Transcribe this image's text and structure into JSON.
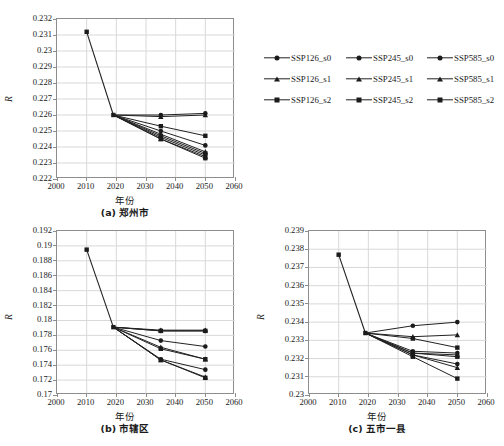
{
  "figure": {
    "axis_y_title": "R",
    "axis_x_title": "年份",
    "panels": [
      {
        "id": "a",
        "caption": "(a) 郑州市",
        "xlim": [
          2000,
          2060
        ],
        "xticks": [
          "2000",
          "2010",
          "2020",
          "2030",
          "2040",
          "2050",
          "2060"
        ],
        "ylim": [
          0.222,
          0.232
        ],
        "yticks": [
          "0.232",
          "0.231",
          "0.23",
          "0.229",
          "0.228",
          "0.227",
          "0.226",
          "0.225",
          "0.224",
          "0.223",
          "0.222"
        ]
      },
      {
        "id": "b",
        "caption": "(b) 市辖区",
        "xlim": [
          2000,
          2060
        ],
        "xticks": [
          "2000",
          "2010",
          "2020",
          "2030",
          "2040",
          "2050",
          "2060"
        ],
        "ylim": [
          0.17,
          0.192
        ],
        "yticks": [
          "0.192",
          "0.19",
          "0.188",
          "0.186",
          "0.184",
          "0.182",
          "0.18",
          "0.178",
          "0.176",
          "0.174",
          "0.172",
          "0.17"
        ]
      },
      {
        "id": "c",
        "caption": "(c) 五市一县",
        "xlim": [
          2000,
          2060
        ],
        "xticks": [
          "2000",
          "2010",
          "2020",
          "2030",
          "2040",
          "2050",
          "2060"
        ],
        "ylim": [
          0.23,
          0.239
        ],
        "yticks": [
          "0.239",
          "0.238",
          "0.237",
          "0.236",
          "0.235",
          "0.234",
          "0.233",
          "0.232",
          "0.231",
          "0.23"
        ]
      }
    ]
  },
  "legend": {
    "position": "right-top",
    "rows": [
      [
        {
          "label": "SSP126_s0",
          "marker": "circle"
        },
        {
          "label": "SSP245_s0",
          "marker": "circle"
        },
        {
          "label": "SSP585_s0",
          "marker": "circle"
        }
      ],
      [
        {
          "label": "SSP126_s1",
          "marker": "triangle"
        },
        {
          "label": "SSP245_s1",
          "marker": "triangle"
        },
        {
          "label": "SSP585_s1",
          "marker": "triangle"
        }
      ],
      [
        {
          "label": "SSP126_s2",
          "marker": "square"
        },
        {
          "label": "SSP245_s2",
          "marker": "square"
        },
        {
          "label": "SSP585_s2",
          "marker": "square"
        }
      ]
    ]
  },
  "chart_data": [
    {
      "type": "line",
      "id": "a",
      "title": "(a) 郑州市",
      "xlabel": "年份",
      "ylabel": "R",
      "xlim": [
        2000,
        2060
      ],
      "ylim": [
        0.222,
        0.232
      ],
      "ytick_step": 0.001,
      "xtick_step": 10,
      "grid": true,
      "legend": "shared-right",
      "x": [
        2010,
        2019,
        2035,
        2050
      ],
      "historical": {
        "x": [
          2010,
          2019
        ],
        "values": [
          0.2312,
          0.226
        ],
        "marker": "square"
      },
      "series": [
        {
          "name": "SSP126_s0",
          "marker": "circle",
          "values": [
            null,
            0.226,
            0.226,
            0.2261
          ]
        },
        {
          "name": "SSP126_s1",
          "marker": "triangle",
          "values": [
            null,
            0.226,
            0.2259,
            0.226
          ]
        },
        {
          "name": "SSP126_s2",
          "marker": "square",
          "values": [
            null,
            0.226,
            0.2253,
            0.2247
          ]
        },
        {
          "name": "SSP245_s0",
          "marker": "circle",
          "values": [
            null,
            0.226,
            0.225,
            0.2241
          ]
        },
        {
          "name": "SSP245_s1",
          "marker": "triangle",
          "values": [
            null,
            0.226,
            0.2248,
            0.2237
          ]
        },
        {
          "name": "SSP245_s2",
          "marker": "square",
          "values": [
            null,
            0.226,
            0.2247,
            0.2236
          ]
        },
        {
          "name": "SSP585_s0",
          "marker": "circle",
          "values": [
            null,
            0.226,
            0.2246,
            0.2235
          ]
        },
        {
          "name": "SSP585_s1",
          "marker": "triangle",
          "values": [
            null,
            0.226,
            0.2245,
            0.2234
          ]
        },
        {
          "name": "SSP585_s2",
          "marker": "square",
          "values": [
            null,
            0.226,
            0.2245,
            0.2233
          ]
        }
      ]
    },
    {
      "type": "line",
      "id": "b",
      "title": "(b) 市辖区",
      "xlabel": "年份",
      "ylabel": "R",
      "xlim": [
        2000,
        2060
      ],
      "ylim": [
        0.17,
        0.192
      ],
      "ytick_step": 0.002,
      "xtick_step": 10,
      "grid": true,
      "legend": "shared-right",
      "x": [
        2010,
        2019,
        2035,
        2050
      ],
      "historical": {
        "x": [
          2010,
          2019
        ],
        "values": [
          0.1895,
          0.1791
        ],
        "marker": "square"
      },
      "series": [
        {
          "name": "SSP126_s0",
          "marker": "circle",
          "values": [
            null,
            0.1791,
            0.1786,
            0.1786
          ]
        },
        {
          "name": "SSP126_s1",
          "marker": "triangle",
          "values": [
            null,
            0.1791,
            0.1787,
            0.1787
          ]
        },
        {
          "name": "SSP126_s2",
          "marker": "square",
          "values": [
            null,
            0.1791,
            0.1786,
            0.1786
          ]
        },
        {
          "name": "SSP245_s0",
          "marker": "circle",
          "values": [
            null,
            0.1791,
            0.1773,
            0.1765
          ]
        },
        {
          "name": "SSP245_s1",
          "marker": "triangle",
          "values": [
            null,
            0.1791,
            0.1764,
            0.1748
          ]
        },
        {
          "name": "SSP245_s2",
          "marker": "square",
          "values": [
            null,
            0.1791,
            0.1762,
            0.1748
          ]
        },
        {
          "name": "SSP585_s0",
          "marker": "circle",
          "values": [
            null,
            0.1791,
            0.1748,
            0.1734
          ]
        },
        {
          "name": "SSP585_s1",
          "marker": "triangle",
          "values": [
            null,
            0.1791,
            0.1747,
            0.1724
          ]
        },
        {
          "name": "SSP585_s2",
          "marker": "square",
          "values": [
            null,
            0.1791,
            0.1747,
            0.1723
          ]
        }
      ]
    },
    {
      "type": "line",
      "id": "c",
      "title": "(c) 五市一县",
      "xlabel": "年份",
      "ylabel": "R",
      "xlim": [
        2000,
        2060
      ],
      "ylim": [
        0.23,
        0.239
      ],
      "ytick_step": 0.001,
      "xtick_step": 10,
      "grid": true,
      "legend": "shared-right",
      "x": [
        2010,
        2019,
        2035,
        2050
      ],
      "historical": {
        "x": [
          2010,
          2019
        ],
        "values": [
          0.2377,
          0.2334
        ],
        "marker": "square"
      },
      "series": [
        {
          "name": "SSP126_s0",
          "marker": "circle",
          "values": [
            null,
            0.2334,
            0.2338,
            0.234
          ]
        },
        {
          "name": "SSP126_s1",
          "marker": "triangle",
          "values": [
            null,
            0.2334,
            0.2332,
            0.2333
          ]
        },
        {
          "name": "SSP126_s2",
          "marker": "square",
          "values": [
            null,
            0.2334,
            0.2331,
            0.2326
          ]
        },
        {
          "name": "SSP245_s0",
          "marker": "circle",
          "values": [
            null,
            0.2334,
            0.2324,
            0.2323
          ]
        },
        {
          "name": "SSP245_s1",
          "marker": "triangle",
          "values": [
            null,
            0.2334,
            0.2323,
            0.2322
          ]
        },
        {
          "name": "SSP245_s2",
          "marker": "square",
          "values": [
            null,
            0.2334,
            0.2323,
            0.2321
          ]
        },
        {
          "name": "SSP585_s0",
          "marker": "circle",
          "values": [
            null,
            0.2334,
            0.2322,
            0.2317
          ]
        },
        {
          "name": "SSP585_s1",
          "marker": "triangle",
          "values": [
            null,
            0.2334,
            0.2322,
            0.2315
          ]
        },
        {
          "name": "SSP585_s2",
          "marker": "square",
          "values": [
            null,
            0.2334,
            0.2321,
            0.2309
          ]
        }
      ]
    }
  ],
  "style": {
    "line_color": "#222222",
    "marker_color": "#1b1b1b",
    "grid_color": "#d8d8d8",
    "frame_color": "#8d8d8d",
    "background": "#ffffff"
  }
}
